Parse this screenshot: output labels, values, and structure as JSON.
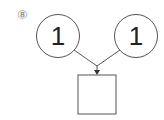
{
  "problem_label": "⑧",
  "nodes": {
    "left": {
      "value": "1"
    },
    "right": {
      "value": "1"
    },
    "result": {
      "value": ""
    }
  },
  "colors": {
    "stroke": "#555555",
    "text": "#222222",
    "label": "#888888"
  }
}
